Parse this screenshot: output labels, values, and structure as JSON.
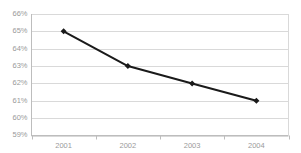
{
  "chart_data": {
    "type": "line",
    "title": "",
    "subtitle": "",
    "xlabel": "",
    "ylabel": "",
    "categories": [
      "2001",
      "2002",
      "2003",
      "2004"
    ],
    "values": [
      65,
      63,
      62,
      61
    ],
    "value_labels": [
      "65%",
      "63%",
      "62%",
      "61%"
    ],
    "ylim": [
      59,
      66
    ],
    "yticks": [
      66,
      65,
      64,
      63,
      62,
      61,
      60,
      59
    ],
    "ytick_labels": [
      "66%",
      "65%",
      "64%",
      "63%",
      "62%",
      "61%",
      "60%",
      "59%"
    ],
    "grid": true,
    "grid_axis": "y",
    "legend": false,
    "legend_position": "none",
    "series": [
      {
        "name": "",
        "values": [
          65,
          63,
          62,
          61
        ]
      }
    ],
    "colors": {
      "line": "#1a1a1a",
      "marker": "#1a1a1a",
      "grid": "#d9d9d9",
      "axis": "#bdbdbd",
      "tick_label": "#9a9a9a",
      "background": "#ffffff"
    },
    "style": {
      "line_width": 2,
      "marker": "diamond",
      "marker_size": 4
    }
  },
  "axes": {
    "y_tick_labels": [
      "66%",
      "65%",
      "64%",
      "63%",
      "62%",
      "61%",
      "60%",
      "59%"
    ],
    "x_tick_labels": [
      "2001",
      "2002",
      "2003",
      "2004"
    ]
  }
}
